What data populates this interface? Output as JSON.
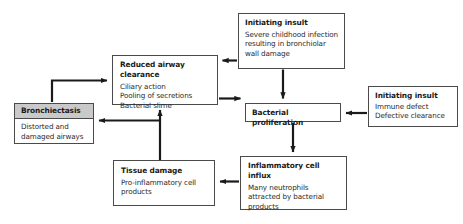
{
  "diagram": {
    "type": "flowchart",
    "colors": {
      "box_border": "#4a4a4a",
      "box_fill": "#ffffff",
      "header_fill": "#c9c9c9",
      "arrow": "#1a1a1a",
      "text": "#1a1a1a"
    }
  },
  "nodes": {
    "initiating_insult_top": {
      "title": "Initiating insult",
      "lines": [
        "Severe childhood infection",
        "resulting in bronchiolar",
        "wall damage"
      ]
    },
    "reduced_airway_clearance": {
      "title": "Reduced airway clearance",
      "lines": [
        "Ciliary action",
        "Pooling of secretions",
        "Bacterial slime"
      ]
    },
    "bronchiectasis": {
      "title": "Bronchiectasis",
      "lines": [
        "Distorted and",
        "damaged airways"
      ]
    },
    "bacterial_proliferation": {
      "title": "Bacterial proliferation",
      "lines": []
    },
    "initiating_insult_right": {
      "title": "Initiating insult",
      "lines": [
        "Immune defect",
        "Defective clearance"
      ]
    },
    "inflammatory_cell_influx": {
      "title": "Inflammatory cell influx",
      "lines": [
        "Many neutrophils",
        "attracted by bacterial",
        "products"
      ]
    },
    "tissue_damage": {
      "title": "Tissue damage",
      "lines": [
        "Pro-inflammatory cell",
        "products"
      ]
    }
  },
  "edges": [
    {
      "name": "initiating-insult-top-to-reduced-airway-clearance",
      "from": "initiating_insult_top",
      "to": "reduced_airway_clearance",
      "direction": "left"
    },
    {
      "name": "initiating-insult-top-to-bacterial-proliferation",
      "from": "initiating_insult_top",
      "to": "bacterial_proliferation",
      "direction": "down"
    },
    {
      "name": "reduced-airway-clearance-to-bacterial-proliferation",
      "from": "reduced_airway_clearance",
      "to": "bacterial_proliferation",
      "direction": "right"
    },
    {
      "name": "initiating-insult-right-to-bacterial-proliferation",
      "from": "initiating_insult_right",
      "to": "bacterial_proliferation",
      "direction": "left"
    },
    {
      "name": "bacterial-proliferation-to-inflammatory-cell-influx",
      "from": "bacterial_proliferation",
      "to": "inflammatory_cell_influx",
      "direction": "down"
    },
    {
      "name": "inflammatory-cell-influx-to-tissue-damage",
      "from": "inflammatory_cell_influx",
      "to": "tissue_damage",
      "direction": "left"
    },
    {
      "name": "tissue-damage-to-reduced-airway-clearance",
      "from": "tissue_damage",
      "to": "reduced_airway_clearance",
      "direction": "up"
    },
    {
      "name": "tissue-damage-to-bronchiectasis",
      "from": "tissue_damage",
      "to": "bronchiectasis",
      "direction": "left"
    },
    {
      "name": "bronchiectasis-to-reduced-airway-clearance",
      "from": "bronchiectasis",
      "to": "reduced_airway_clearance",
      "direction": "up-right"
    }
  ]
}
